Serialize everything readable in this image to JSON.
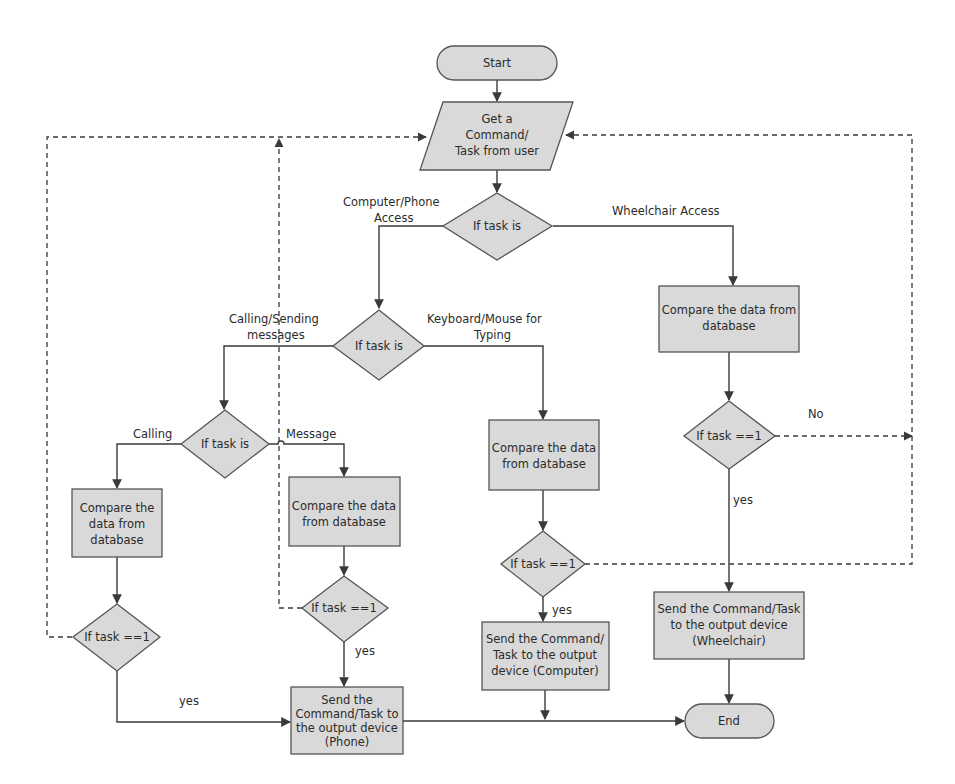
{
  "diagram": {
    "type": "flowchart",
    "nodes": {
      "start": {
        "label": "Start",
        "shape": "terminator"
      },
      "input": {
        "lines": [
          "Get a",
          "Command/",
          "Task from user"
        ],
        "shape": "parallelogram"
      },
      "decision_main": {
        "label": "If task is",
        "shape": "diamond"
      },
      "decision_device": {
        "label": "If task is",
        "shape": "diamond"
      },
      "decision_phone": {
        "label": "If task is",
        "shape": "diamond"
      },
      "compare_wheelchair": {
        "lines": [
          "Compare the data from",
          "database"
        ],
        "shape": "process"
      },
      "compare_calling": {
        "lines": [
          "Compare the",
          "data from",
          "database"
        ],
        "shape": "process"
      },
      "compare_message": {
        "lines": [
          "Compare the data",
          "from database"
        ],
        "shape": "process"
      },
      "compare_keyboard": {
        "lines": [
          "Compare the data",
          "from database"
        ],
        "shape": "process"
      },
      "check_wheelchair": {
        "label": "If task ==1",
        "shape": "diamond"
      },
      "check_calling": {
        "label": "If task ==1",
        "shape": "diamond"
      },
      "check_message": {
        "label": "If task ==1",
        "shape": "diamond"
      },
      "check_keyboard": {
        "label": "If task ==1",
        "shape": "diamond"
      },
      "send_phone": {
        "lines": [
          "Send the",
          "Command/Task to",
          "the output device",
          "(Phone)"
        ],
        "shape": "process"
      },
      "send_computer": {
        "lines": [
          "Send the Command/",
          "Task to the output",
          "device (Computer)"
        ],
        "shape": "process"
      },
      "send_wheelchair": {
        "lines": [
          "Send the Command/Task",
          "to the output device",
          "(Wheelchair)"
        ],
        "shape": "process"
      },
      "end": {
        "label": "End",
        "shape": "terminator"
      }
    },
    "edge_labels": {
      "computer_phone_access": [
        "Computer/Phone",
        "Access"
      ],
      "wheelchair_access": "Wheelchair Access",
      "calling_sending": [
        "Calling/Sending",
        "messages"
      ],
      "keyboard_mouse": [
        "Keyboard/Mouse for",
        "Typing"
      ],
      "calling": "Calling",
      "message": "Message",
      "no": "No",
      "yes_wheelchair": "yes",
      "yes_keyboard": "yes",
      "yes_message": "yes",
      "yes_calling": "yes"
    },
    "colors": {
      "node_fill": "#d9d9d9",
      "node_stroke": "#555555",
      "line": "#3a3a3a",
      "text": "#2b2b2b",
      "background": "#ffffff"
    }
  }
}
